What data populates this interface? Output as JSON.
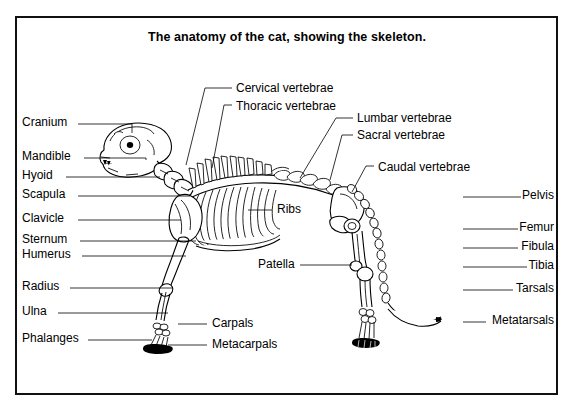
{
  "figure": {
    "title": "The anatomy of the cat, showing the skeleton.",
    "border_color": "#111111",
    "background_color": "#ffffff",
    "ink_color": "#000000"
  },
  "labels_left": [
    {
      "text": "Cranium",
      "x": 22,
      "y": 126,
      "line_x1": 78,
      "line_x2": 132,
      "line_y": 124,
      "tip_x": 132,
      "tip_y": 133
    },
    {
      "text": "Mandible",
      "x": 22,
      "y": 160,
      "line_x1": 84,
      "line_x2": 146,
      "line_y": 158,
      "tip_x": 146,
      "tip_y": 160
    },
    {
      "text": "Hyoid",
      "x": 22,
      "y": 179,
      "line_x1": 66,
      "line_x2": 160,
      "line_y": 177,
      "tip_x": 160,
      "tip_y": 177
    },
    {
      "text": "Scapula",
      "x": 22,
      "y": 198,
      "line_x1": 78,
      "line_x2": 190,
      "line_y": 196,
      "tip_x": 190,
      "tip_y": 196
    },
    {
      "text": "Clavicle",
      "x": 22,
      "y": 222,
      "line_x1": 78,
      "line_x2": 181,
      "line_y": 220,
      "tip_x": 181,
      "tip_y": 220
    },
    {
      "text": "Sternum",
      "x": 22,
      "y": 243,
      "line_x1": 80,
      "line_x2": 196,
      "line_y": 241,
      "tip_x": 196,
      "tip_y": 241
    },
    {
      "text": "Humerus",
      "x": 22,
      "y": 258,
      "line_x1": 82,
      "line_x2": 186,
      "line_y": 256,
      "tip_x": 186,
      "tip_y": 256
    },
    {
      "text": "Radius",
      "x": 22,
      "y": 290,
      "line_x1": 70,
      "line_x2": 172,
      "line_y": 288,
      "tip_x": 172,
      "tip_y": 288
    },
    {
      "text": "Ulna",
      "x": 22,
      "y": 315,
      "line_x1": 58,
      "line_x2": 168,
      "line_y": 313,
      "tip_x": 168,
      "tip_y": 313
    },
    {
      "text": "Phalanges",
      "x": 22,
      "y": 342,
      "line_x1": 88,
      "line_x2": 152,
      "line_y": 340,
      "tip_x": 152,
      "tip_y": 340
    }
  ],
  "labels_right": [
    {
      "text": "Pelvis",
      "x": 554,
      "y": 199,
      "line_x1": 463,
      "line_x2": 521,
      "line_y": 197
    },
    {
      "text": "Femur",
      "x": 554,
      "y": 231,
      "line_x1": 463,
      "line_x2": 518,
      "line_y": 229
    },
    {
      "text": "Fibula",
      "x": 554,
      "y": 250,
      "line_x1": 463,
      "line_x2": 518,
      "line_y": 248
    },
    {
      "text": "Tibia",
      "x": 554,
      "y": 269,
      "line_x1": 463,
      "line_x2": 527,
      "line_y": 267
    },
    {
      "text": "Tarsals",
      "x": 554,
      "y": 292,
      "line_x1": 463,
      "line_x2": 513,
      "line_y": 290
    },
    {
      "text": "Metatarsals",
      "x": 554,
      "y": 324,
      "line_x1": 463,
      "line_x2": 486,
      "line_y": 322
    }
  ],
  "labels_inner": [
    {
      "text": "Ribs",
      "x": 277,
      "y": 213,
      "line_x1": 248,
      "line_x2": 272,
      "line_y": 210
    },
    {
      "text": "Patella",
      "x": 258,
      "y": 268,
      "line_x1": 300,
      "line_x2": 352,
      "line_y": 265
    },
    {
      "text": "Carpals",
      "x": 212,
      "y": 327,
      "line_x1": 178,
      "line_x2": 207,
      "line_y": 324
    },
    {
      "text": "Metacarpals",
      "x": 212,
      "y": 348,
      "line_x1": 168,
      "line_x2": 207,
      "line_y": 345
    }
  ],
  "labels_vertebrae": [
    {
      "text": "Cervical vertebrae",
      "x": 236,
      "y": 92,
      "leader": "M232,88 L205,88 L186,165"
    },
    {
      "text": "Thoracic vertebrae",
      "x": 236,
      "y": 110,
      "leader": "M232,105 L224,105 L212,168"
    },
    {
      "text": "Lumbar vertebrae",
      "x": 357,
      "y": 122,
      "leader": "M353,118 L336,118 L300,178"
    },
    {
      "text": "Sacral vertebrae",
      "x": 357,
      "y": 139,
      "leader": "M353,135 L342,135 L330,180"
    },
    {
      "text": "Caudal vertebrae",
      "x": 378,
      "y": 171,
      "leader": "M374,166 L366,166 L352,192"
    }
  ]
}
